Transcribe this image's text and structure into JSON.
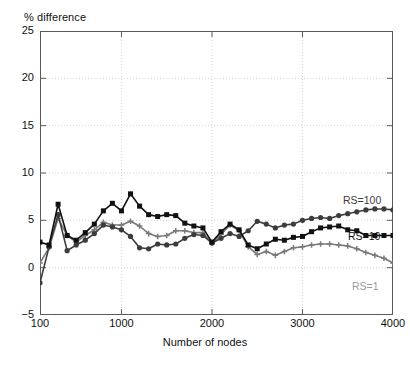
{
  "chart_data": {
    "type": "line",
    "title": "",
    "ylabel": "% difference",
    "xlabel": "Number of nodes",
    "xlim": [
      100,
      4000
    ],
    "ylim": [
      -5,
      25
    ],
    "xticks": [
      100,
      1000,
      2000,
      3000,
      4000
    ],
    "yticks": [
      -5,
      0,
      5,
      10,
      15,
      20,
      25
    ],
    "grid": true,
    "legend_position": "inline-right",
    "x": [
      100,
      200,
      300,
      400,
      500,
      600,
      700,
      800,
      900,
      1000,
      1100,
      1200,
      1300,
      1400,
      1500,
      1600,
      1700,
      1800,
      1900,
      2000,
      2100,
      2200,
      2300,
      2400,
      2500,
      2600,
      2700,
      2800,
      2900,
      3000,
      3100,
      3200,
      3300,
      3400,
      3500,
      3600,
      3700,
      3800,
      3900,
      4000
    ],
    "series": [
      {
        "name": "RS=100",
        "color": "#3c3c3c",
        "marker": "circle",
        "values": [
          -1.6,
          2.2,
          5.6,
          1.8,
          2.4,
          2.9,
          3.6,
          4.5,
          4.3,
          4.0,
          3.3,
          2.1,
          2.0,
          2.5,
          2.4,
          2.5,
          3.1,
          3.5,
          3.4,
          2.6,
          3.1,
          3.6,
          3.3,
          3.9,
          4.9,
          4.6,
          4.2,
          4.5,
          4.6,
          5.0,
          5.2,
          5.3,
          5.2,
          5.5,
          5.7,
          5.9,
          6.1,
          6.2,
          6.2,
          6.1
        ]
      },
      {
        "name": "RS=10",
        "color": "#111111",
        "marker": "square",
        "values": [
          2.7,
          2.4,
          6.7,
          3.4,
          2.9,
          3.7,
          4.6,
          6.0,
          6.8,
          6.0,
          7.8,
          6.5,
          5.6,
          5.4,
          5.6,
          5.5,
          4.7,
          4.4,
          4.2,
          2.7,
          3.8,
          4.6,
          4.0,
          2.4,
          2.0,
          2.5,
          3.0,
          2.9,
          3.2,
          3.3,
          3.8,
          4.2,
          4.3,
          4.4,
          4.0,
          3.9,
          3.4,
          3.4,
          3.4,
          3.4
        ]
      },
      {
        "name": "RS=1",
        "color": "#7a7a7a",
        "marker": "plus",
        "values": [
          0.5,
          2.1,
          5.2,
          3.4,
          2.7,
          3.4,
          4.0,
          4.8,
          4.5,
          4.5,
          4.9,
          4.4,
          3.6,
          3.3,
          3.4,
          3.9,
          3.9,
          3.7,
          3.7,
          2.6,
          3.5,
          4.5,
          3.9,
          2.2,
          1.4,
          1.7,
          1.3,
          1.7,
          2.1,
          2.2,
          2.4,
          2.5,
          2.5,
          2.4,
          2.3,
          2.0,
          1.6,
          1.3,
          1.0,
          0.5
        ]
      }
    ],
    "annotations": [
      {
        "text": "RS=100",
        "color": "#3c3c3c"
      },
      {
        "text": "RS=10",
        "color": "#111111"
      },
      {
        "text": "RS=1",
        "color": "#9a9a9a"
      }
    ]
  },
  "axis": {
    "ylabel_top": "% difference",
    "xlabel": "Number of nodes",
    "yticks": [
      "25",
      "20",
      "15",
      "10",
      "5",
      "0",
      "-5"
    ],
    "xticks": [
      "100",
      "1000",
      "2000",
      "3000",
      "4000"
    ]
  }
}
